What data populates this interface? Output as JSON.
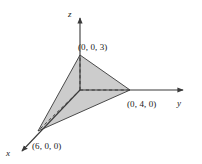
{
  "figure": {
    "kind": "3d-coordinate-axes-triangle",
    "background_color": "#ffffff",
    "stroke_color": "#3a3a3a",
    "label_color": "#1a1a1a",
    "plane_fill_color": "#c9c9c9",
    "plane_stroke_color": "#4a4a4a",
    "dash_color": "#3a3a3a"
  },
  "axes": {
    "x": {
      "label": "x",
      "origin": {
        "x": 80,
        "y": 90
      },
      "tip": {
        "x": 17,
        "y": 156
      },
      "label_pos": {
        "x": 6,
        "y": 156
      }
    },
    "y": {
      "label": "y",
      "origin": {
        "x": 80,
        "y": 90
      },
      "tip": {
        "x": 189,
        "y": 90
      },
      "label_pos": {
        "x": 177,
        "y": 106
      }
    },
    "z": {
      "label": "z",
      "origin": {
        "x": 80,
        "y": 90
      },
      "tip": {
        "x": 80,
        "y": 13
      },
      "label_pos": {
        "x": 68,
        "y": 17
      }
    }
  },
  "points": [
    {
      "name": "z-intercept",
      "label": "(0, 0, 3)",
      "vertex": {
        "x": 80,
        "y": 55
      },
      "label_pos": {
        "x": 78,
        "y": 50
      }
    },
    {
      "name": "y-intercept",
      "label": "(0, 4, 0)",
      "vertex": {
        "x": 130,
        "y": 90
      },
      "label_pos": {
        "x": 127,
        "y": 107
      }
    },
    {
      "name": "x-intercept",
      "label": "(6, 0, 0)",
      "vertex": {
        "x": 38,
        "y": 131
      },
      "label_pos": {
        "x": 32,
        "y": 149
      }
    }
  ],
  "plane": {
    "name": "shaded-triangle",
    "polygon": "80,55 130,90 38,131"
  },
  "guides": [
    {
      "name": "origin-to-z-dash",
      "x1": 80,
      "y1": 90,
      "x2": 80,
      "y2": 55
    },
    {
      "name": "origin-to-y-dash",
      "x1": 80,
      "y1": 90,
      "x2": 130,
      "y2": 90
    },
    {
      "name": "origin-to-x-dash",
      "x1": 80,
      "y1": 90,
      "x2": 38,
      "y2": 131
    }
  ],
  "chart_data": {
    "type": "scatter",
    "title": "",
    "xlabel": "x",
    "ylabel": "y",
    "zlabel": "z",
    "labels": [
      "(6, 0, 0)",
      "(0, 4, 0)",
      "(0, 0, 3)"
    ],
    "points_3d": [
      {
        "label": "(6, 0, 0)",
        "x": 6,
        "y": 0,
        "z": 0
      },
      {
        "label": "(0, 4, 0)",
        "x": 0,
        "y": 4,
        "z": 0
      },
      {
        "label": "(0, 0, 3)",
        "x": 0,
        "y": 0,
        "z": 3
      }
    ],
    "axis_labels": [
      "x",
      "y",
      "z"
    ],
    "grid": false,
    "legend": false
  }
}
